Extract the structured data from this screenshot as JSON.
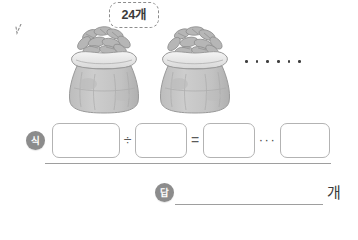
{
  "worksheet": {
    "bubble": {
      "label": "24개",
      "icon": "speech-bubble-tail"
    },
    "illustration": {
      "sack_one_name": "sack-of-corn-1",
      "sack_two_name": "sack-of-corn-2",
      "ellipsis": "······"
    },
    "equation": {
      "badge_label": "식",
      "box1_value": "",
      "box2_value": "",
      "box3_value": "",
      "box4_value": "",
      "box1_placeholder": "",
      "box2_placeholder": "",
      "box3_placeholder": "",
      "box4_placeholder": "",
      "divide_symbol": "÷",
      "equals_symbol": "=",
      "remainder_symbol": "···"
    },
    "answer": {
      "badge_label": "답",
      "value": "",
      "placeholder": "",
      "unit": "개"
    },
    "colors": {
      "badge": "#8c8c8c",
      "box_border": "#b3b3b3",
      "rule": "#9e9e9e",
      "bubble_border": "#8d8d8d",
      "sack_body": "#c9c9c9",
      "sack_collar": "#ececec",
      "text": "#3b3b3b"
    }
  }
}
